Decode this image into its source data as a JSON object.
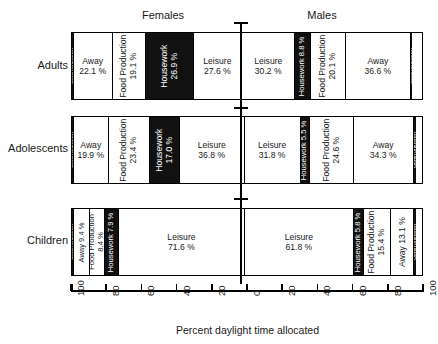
{
  "chart_data": {
    "type": "bar",
    "subtype": "diverging-stacked-bar",
    "title": "",
    "xlabel": "Percent daylight time allocated",
    "ylabel": "",
    "xlim": [
      -100,
      100
    ],
    "grid": false,
    "legend_position": "none",
    "group_headers": [
      "Females",
      "Males"
    ],
    "categories": [
      "Adults",
      "Adolescents",
      "Children"
    ],
    "tick_labels": [
      "100",
      "80",
      "60",
      "40",
      "20",
      "0",
      "20",
      "40",
      "60",
      "80",
      "100"
    ],
    "tick_values": [
      -100,
      -80,
      -60,
      -40,
      -20,
      0,
      20,
      40,
      60,
      80,
      100
    ],
    "activities": [
      "Other/Unknown",
      "Away",
      "Food Production",
      "Housework",
      "Leisure"
    ],
    "rows": [
      {
        "category": "Adults",
        "female": [
          {
            "label": "Other/Unknown",
            "value": 1.0,
            "text": "Other/Unknown",
            "style": "edge",
            "orient": "vertical"
          },
          {
            "label": "Away",
            "value": 22.1,
            "text": "Away",
            "pct": "22.1 %",
            "style": "light",
            "orient": "horizontal"
          },
          {
            "label": "Food Production",
            "value": 19.1,
            "text": "Food Production",
            "pct": "19.1 %",
            "style": "light",
            "orient": "vertical"
          },
          {
            "label": "Housework",
            "value": 26.9,
            "text": "Housework",
            "pct": "26.9 %",
            "style": "dark",
            "orient": "vertical"
          },
          {
            "label": "Leisure",
            "value": 27.6,
            "text": "Leisure",
            "pct": "27.6 %",
            "style": "light",
            "orient": "horizontal"
          }
        ],
        "male": [
          {
            "label": "Leisure",
            "value": 30.2,
            "text": "Leisure",
            "pct": "30.2 %",
            "style": "light",
            "orient": "horizontal"
          },
          {
            "label": "Housework",
            "value": 8.8,
            "text": "Housework 8.8 %",
            "style": "dark",
            "orient": "vertical"
          },
          {
            "label": "Food Production",
            "value": 20.1,
            "text": "Food Production",
            "pct": "20.1 %",
            "style": "light",
            "orient": "vertical"
          },
          {
            "label": "Away",
            "value": 36.6,
            "text": "Away",
            "pct": "36.6 %",
            "style": "light",
            "orient": "horizontal"
          },
          {
            "label": "Other/Unknown",
            "value": 1.0,
            "text": "Other/Unknown",
            "style": "edge",
            "orient": "vertical"
          }
        ]
      },
      {
        "category": "Adolescents",
        "female": [
          {
            "label": "Other/Unknown",
            "value": 1.0,
            "text": "Other/Unknown",
            "style": "edge",
            "orient": "vertical"
          },
          {
            "label": "Away",
            "value": 19.9,
            "text": "Away",
            "pct": "19.9 %",
            "style": "light",
            "orient": "horizontal"
          },
          {
            "label": "Food Production",
            "value": 23.4,
            "text": "Food Production",
            "pct": "23.4 %",
            "style": "light",
            "orient": "vertical"
          },
          {
            "label": "Housework",
            "value": 17.0,
            "text": "Housework",
            "pct": "17.0 %",
            "style": "dark",
            "orient": "vertical"
          },
          {
            "label": "Leisure",
            "value": 36.8,
            "text": "Leisure",
            "pct": "36.8 %",
            "style": "light",
            "orient": "horizontal"
          }
        ],
        "male": [
          {
            "label": "Leisure",
            "value": 31.8,
            "text": "Leisure",
            "pct": "31.8 %",
            "style": "light",
            "orient": "horizontal"
          },
          {
            "label": "Housework",
            "value": 5.5,
            "text": "Housework 5.5 %",
            "style": "dark",
            "orient": "vertical"
          },
          {
            "label": "Food Production",
            "value": 24.6,
            "text": "Food Production",
            "pct": "24.6 %",
            "style": "light",
            "orient": "vertical"
          },
          {
            "label": "Away",
            "value": 34.3,
            "text": "Away",
            "pct": "34.3 %",
            "style": "light",
            "orient": "horizontal"
          },
          {
            "label": "Other/Unknown",
            "value": 1.0,
            "text": "Other/Unknown",
            "style": "edge",
            "orient": "vertical"
          }
        ]
      },
      {
        "category": "Children",
        "female": [
          {
            "label": "Other/Unknown",
            "value": 1.0,
            "text": "Other/Unknown",
            "style": "edge",
            "orient": "vertical"
          },
          {
            "label": "Away",
            "value": 9.4,
            "text": "Away 9.4 %",
            "style": "light",
            "orient": "vertical"
          },
          {
            "label": "Food Production",
            "value": 8.4,
            "text": "Food Production",
            "pct": "8.4 %",
            "style": "light",
            "orient": "vertical"
          },
          {
            "label": "Housework",
            "value": 7.9,
            "text": "Housework 7.9 %",
            "style": "dark",
            "orient": "vertical"
          },
          {
            "label": "Leisure",
            "value": 71.6,
            "text": "Leisure",
            "pct": "71.6 %",
            "style": "light",
            "orient": "horizontal"
          }
        ],
        "male": [
          {
            "label": "Leisure",
            "value": 61.8,
            "text": "Leisure",
            "pct": "61.8 %",
            "style": "light",
            "orient": "horizontal"
          },
          {
            "label": "Housework",
            "value": 5.8,
            "text": "Housework 5.8 %",
            "style": "dark",
            "orient": "vertical"
          },
          {
            "label": "Food Production",
            "value": 15.4,
            "text": "Food Production",
            "pct": "15.4 %",
            "style": "light",
            "orient": "vertical"
          },
          {
            "label": "Away",
            "value": 13.1,
            "text": "Away 13.1 %",
            "style": "light",
            "orient": "vertical"
          },
          {
            "label": "Other/Unknown",
            "value": 1.0,
            "text": "Other/Unknown",
            "style": "edge",
            "orient": "vertical"
          }
        ]
      }
    ]
  },
  "colors": {
    "dark_fill": "#111111",
    "light_fill": "#ffffff",
    "stroke": "#000000",
    "text": "#1a1a1a",
    "background": "#ffffff"
  }
}
